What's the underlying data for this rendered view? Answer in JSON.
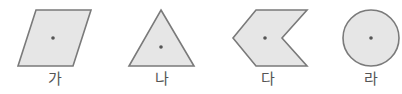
{
  "figure": {
    "fill_color": "#e6e6e6",
    "stroke_color": "#7a7a7a",
    "dot_color": "#555555",
    "shapes": [
      {
        "id": "ga",
        "label": "가",
        "type": "parallelogram",
        "points": "36,10 91,10 73,66 18,66",
        "center": [
          53,
          38
        ],
        "label_x": 55
      },
      {
        "id": "na",
        "label": "나",
        "type": "triangle",
        "points": "161,10 194,66 129,66",
        "center": [
          161,
          47
        ],
        "label_x": 162
      },
      {
        "id": "da",
        "label": "다",
        "type": "chevron",
        "points": "256,10 307,10 282,38 307,66 256,66 233,38",
        "center": [
          265,
          38
        ],
        "label_x": 268
      },
      {
        "id": "ra",
        "label": "라",
        "type": "circle",
        "cx": 371,
        "cy": 38,
        "r": 28,
        "center": [
          371,
          38
        ],
        "label_x": 371
      }
    ]
  }
}
